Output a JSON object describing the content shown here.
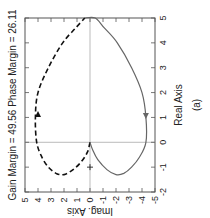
{
  "chart_data": {
    "type": "line",
    "orientation": "rotated-90-clockwise",
    "title": "Gain Margin = 49.56  Phase Margin = 26.11",
    "xlabel": "Real Axis",
    "ylabel": "Imag. Axis",
    "caption": "(a)",
    "xlim": [
      -2,
      5
    ],
    "ylim": [
      -5,
      5
    ],
    "xticks": [
      "-2",
      "-1",
      "0",
      "1",
      "2",
      "3",
      "4",
      "5"
    ],
    "yticks": [
      "5",
      "4",
      "3",
      "2",
      "1",
      "0",
      "-1",
      "-2",
      "-3",
      "-4",
      "-5"
    ],
    "grid": false,
    "reference_lines": {
      "real_zero": true,
      "imag_zero": true
    },
    "critical_point": {
      "real": -1,
      "imag": 0,
      "marker": "+"
    },
    "series": [
      {
        "name": "negative-frequency",
        "style": "dashed",
        "color": "#111111",
        "arrow": {
          "real": 1.1,
          "imag": 4.0,
          "direction": "increasing-real"
        },
        "points": [
          [
            0,
            0
          ],
          [
            -0.4,
            0.2
          ],
          [
            -0.8,
            0.7
          ],
          [
            -1.1,
            1.3
          ],
          [
            -1.3,
            2.0
          ],
          [
            -1.25,
            2.6
          ],
          [
            -1.0,
            3.2
          ],
          [
            -0.6,
            3.7
          ],
          [
            0,
            4.1
          ],
          [
            1.0,
            4.2
          ],
          [
            2.0,
            4.0
          ],
          [
            3.0,
            3.2
          ],
          [
            4.0,
            2.1
          ],
          [
            4.6,
            1.1
          ],
          [
            5.0,
            0.4
          ]
        ]
      },
      {
        "name": "positive-frequency",
        "style": "solid",
        "color": "#666666",
        "arrow": {
          "real": 1.1,
          "imag": -4.3,
          "direction": "decreasing-real"
        },
        "points": [
          [
            5.0,
            0.4
          ],
          [
            5.0,
            -0.4
          ],
          [
            4.6,
            -1.1
          ],
          [
            4.0,
            -2.1
          ],
          [
            3.0,
            -3.2
          ],
          [
            2.0,
            -4.0
          ],
          [
            1.0,
            -4.3
          ],
          [
            0,
            -4.3
          ],
          [
            -0.6,
            -3.8
          ],
          [
            -1.0,
            -3.2
          ],
          [
            -1.25,
            -2.6
          ],
          [
            -1.3,
            -2.0
          ],
          [
            -1.1,
            -1.3
          ],
          [
            -0.7,
            -0.6
          ],
          [
            -0.3,
            -0.2
          ],
          [
            0,
            0
          ]
        ]
      }
    ]
  }
}
